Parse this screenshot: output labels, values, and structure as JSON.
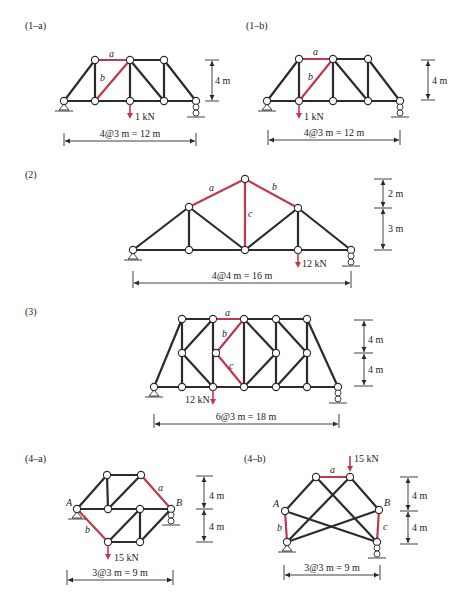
{
  "figures": [
    {
      "id": "1-a",
      "label": "(1–a)",
      "member_labels": {
        "a": "a",
        "b": "b"
      },
      "load": "1 kN",
      "height_dim": "4 m",
      "span_dim": "4@3 m = 12 m"
    },
    {
      "id": "1-b",
      "label": "(1–b)",
      "member_labels": {
        "a": "a",
        "b": "b"
      },
      "load": "1 kN",
      "height_dim": "4 m",
      "span_dim": "4@3 m = 12 m"
    },
    {
      "id": "2",
      "label": "(2)",
      "member_labels": {
        "a": "a",
        "b": "b",
        "c": "c"
      },
      "load": "12 kN",
      "height_dims": [
        "2 m",
        "3 m"
      ],
      "span_dim": "4@4 m = 16 m"
    },
    {
      "id": "3",
      "label": "(3)",
      "member_labels": {
        "a": "a",
        "b": "b",
        "c": "c"
      },
      "load": "12 kN",
      "height_dims": [
        "4 m",
        "4 m"
      ],
      "span_dim": "6@3 m = 18 m"
    },
    {
      "id": "4-a",
      "label": "(4–a)",
      "member_labels": {
        "a": "a",
        "b": "b"
      },
      "node_labels": {
        "A": "A",
        "B": "B"
      },
      "load": "15 kN",
      "height_dims": [
        "4 m",
        "4 m"
      ],
      "span_dim": "3@3 m = 9 m"
    },
    {
      "id": "4-b",
      "label": "(4–b)",
      "member_labels": {
        "a": "a",
        "b": "b",
        "c": "c"
      },
      "node_labels": {
        "A": "A",
        "B": "B"
      },
      "load": "15 kN",
      "height_dims": [
        "4 m",
        "4 m"
      ],
      "span_dim": "3@3 m = 9 m"
    }
  ],
  "colors": {
    "member": "#2b2b2b",
    "highlight_member": "#c0394b",
    "load_arrow": "#c0394b",
    "background": "#ffffff"
  }
}
